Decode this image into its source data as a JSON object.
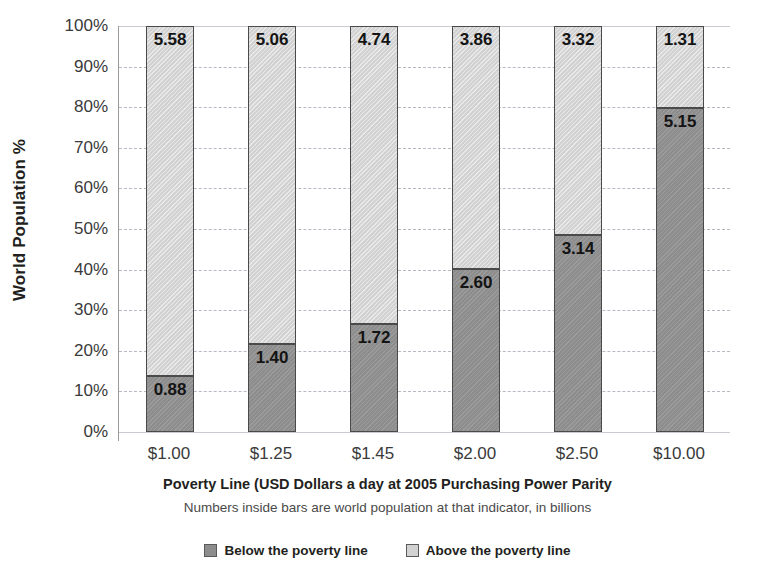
{
  "chart_data": {
    "type": "bar",
    "subtype": "stacked-100-percent",
    "title": "",
    "xlabel": "Poverty Line (USD Dollars a day at 2005 Purchasing Power Parity",
    "ylabel": "World Population %",
    "subcaption": "Numbers inside bars are world population at that indicator, in billions",
    "categories": [
      "$1.00",
      "$1.25",
      "$1.45",
      "$2.00",
      "$2.50",
      "$10.00"
    ],
    "series": [
      {
        "name": "Below the poverty line",
        "color": "#8d8d8d",
        "values": [
          0.88,
          1.4,
          1.72,
          2.6,
          3.14,
          5.15
        ],
        "percents": [
          13.7,
          21.7,
          26.6,
          40.2,
          48.6,
          79.7
        ],
        "labels": [
          "0.88",
          "1.40",
          "1.72",
          "2.60",
          "3.14",
          "5.15"
        ]
      },
      {
        "name": "Above the poverty line",
        "color": "#d2d2d2",
        "values": [
          5.58,
          5.06,
          4.74,
          3.86,
          3.32,
          1.31
        ],
        "percents": [
          86.3,
          78.3,
          73.4,
          59.8,
          51.4,
          20.3
        ],
        "labels": [
          "5.58",
          "5.06",
          "4.74",
          "3.86",
          "3.32",
          "1.31"
        ]
      }
    ],
    "ylim": [
      0,
      100
    ],
    "yticks": [
      "0%",
      "10%",
      "20%",
      "30%",
      "40%",
      "50%",
      "60%",
      "70%",
      "80%",
      "90%",
      "100%"
    ],
    "ytick_values": [
      0,
      10,
      20,
      30,
      40,
      50,
      60,
      70,
      80,
      90,
      100
    ],
    "grid": true,
    "grid_axis": "y",
    "legend_position": "bottom",
    "value_unit": "billions"
  },
  "axes": {
    "y_title": "World Population %",
    "x_title": "Poverty Line (USD Dollars a day at 2005 Purchasing Power Parity"
  },
  "caption": {
    "note": "Numbers inside bars are world population at that indicator, in billions"
  },
  "legend": {
    "items": [
      {
        "label": "Below the poverty line",
        "color": "#8d8d8d"
      },
      {
        "label": "Above the poverty line",
        "color": "#d2d2d2"
      }
    ]
  },
  "colors": {
    "below": "#8d8d8d",
    "above": "#d2d2d2",
    "bar_border": "#4a4a4a",
    "gridline": "#b8b8c4",
    "text": "#231f20",
    "background": "#ffffff"
  }
}
